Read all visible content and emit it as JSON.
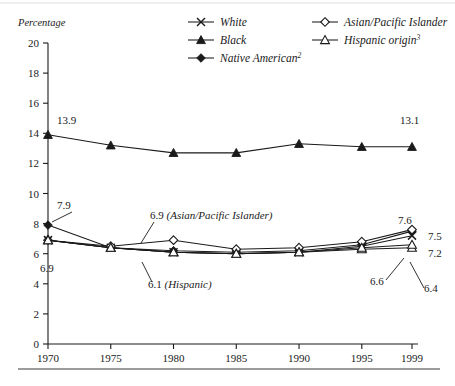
{
  "figure": {
    "y_axis_title": "Percentage",
    "top_rule": true,
    "bottom_rule": true
  },
  "legend": {
    "entries": [
      {
        "label": "White",
        "marker": "x-marker-icon",
        "col": 0,
        "row": 0
      },
      {
        "label": "Black",
        "marker": "filled-triangle-icon",
        "col": 0,
        "row": 1
      },
      {
        "label": "Native American",
        "sup": "2",
        "marker": "filled-diamond-icon",
        "col": 0,
        "row": 2
      },
      {
        "label": "Asian/Pacific Islander",
        "marker": "open-diamond-icon",
        "col": 1,
        "row": 0
      },
      {
        "label": "Hispanic origin",
        "sup": "3",
        "marker": "open-triangle-icon",
        "col": 1,
        "row": 1
      }
    ]
  },
  "annotations": [
    {
      "id": "ann-black-1970",
      "text": "13.9",
      "x": 57,
      "y": 124,
      "anchor": "start",
      "leader": false
    },
    {
      "id": "ann-black-1999",
      "text": "13.1",
      "x": 400,
      "y": 124,
      "anchor": "start",
      "leader": false
    },
    {
      "id": "ann-native-1970",
      "text": "7.9",
      "x": 57,
      "y": 209,
      "anchor": "start",
      "leader": true
    },
    {
      "id": "ann-white-1970",
      "text": "6.9",
      "x": 40,
      "y": 272,
      "anchor": "start",
      "leader": false
    },
    {
      "id": "ann-api-1980",
      "text": "6.9 (Asian/Pacific Islander)",
      "x": 150,
      "y": 219,
      "anchor": "start",
      "leader": true,
      "italic_from": 4
    },
    {
      "id": "ann-hispanic-1980",
      "text": "6.1 (Hispanic)",
      "x": 148,
      "y": 288,
      "anchor": "start",
      "leader": true,
      "italic_from": 4
    },
    {
      "id": "ann-api-1999",
      "text": "7.6",
      "x": 398,
      "y": 224,
      "anchor": "start",
      "leader": false
    },
    {
      "id": "ann-native-1999",
      "text": "7.5",
      "x": 428,
      "y": 240,
      "anchor": "start",
      "leader": false
    },
    {
      "id": "ann-white-1999",
      "text": "7.2",
      "x": 428,
      "y": 257,
      "anchor": "start",
      "leader": false
    },
    {
      "id": "ann-black2-1999",
      "text": "6.6",
      "x": 370,
      "y": 285,
      "anchor": "start",
      "leader": true
    },
    {
      "id": "ann-hispanic-1999",
      "text": "6.4",
      "x": 424,
      "y": 292,
      "anchor": "start",
      "leader": true
    }
  ],
  "chart_data": {
    "type": "line",
    "title": "",
    "xlabel": "",
    "ylabel": "Percentage",
    "x": [
      1970,
      1975,
      1980,
      1985,
      1990,
      1995,
      1999
    ],
    "xtick_labels": [
      "1970",
      "1975",
      "1980",
      "1985",
      "1990",
      "1995",
      "1999"
    ],
    "ytick_labels": [
      "0",
      "2",
      "4",
      "6",
      "8",
      "10",
      "12",
      "14",
      "16",
      "18",
      "20"
    ],
    "ylim": [
      0,
      20
    ],
    "ytick_step": 2,
    "grid": false,
    "legend_position": "top-right",
    "series": [
      {
        "name": "White",
        "marker": "x",
        "values": [
          6.9,
          6.4,
          6.1,
          6.0,
          6.1,
          6.5,
          7.2
        ]
      },
      {
        "name": "Black",
        "marker": "filled-triangle",
        "values": [
          13.9,
          13.2,
          12.7,
          12.7,
          13.3,
          13.1,
          13.1
        ]
      },
      {
        "name": "Native American",
        "marker": "filled-diamond",
        "values": [
          7.9,
          6.4,
          6.2,
          6.1,
          6.2,
          6.6,
          7.5
        ]
      },
      {
        "name": "Asian/Pacific Islander",
        "marker": "open-diamond",
        "values": [
          6.9,
          6.5,
          6.9,
          6.3,
          6.4,
          6.8,
          7.6
        ]
      },
      {
        "name": "Hispanic origin",
        "marker": "open-triangle",
        "values": [
          6.9,
          6.4,
          6.1,
          6.0,
          6.1,
          6.3,
          6.4
        ]
      },
      {
        "name": "Black secondary",
        "marker": "open-triangle",
        "values": [
          6.9,
          6.4,
          6.1,
          6.0,
          6.1,
          6.4,
          6.6
        ]
      }
    ],
    "labeled_points": [
      {
        "series": "Black",
        "x": 1970,
        "value": 13.9
      },
      {
        "series": "Black",
        "x": 1999,
        "value": 13.1
      },
      {
        "series": "Native American",
        "x": 1970,
        "value": 7.9
      },
      {
        "series": "White",
        "x": 1970,
        "value": 6.9
      },
      {
        "series": "Asian/Pacific Islander",
        "x": 1980,
        "value": 6.9
      },
      {
        "series": "Hispanic origin",
        "x": 1980,
        "value": 6.1
      },
      {
        "series": "Asian/Pacific Islander",
        "x": 1999,
        "value": 7.6
      },
      {
        "series": "Native American",
        "x": 1999,
        "value": 7.5
      },
      {
        "series": "White",
        "x": 1999,
        "value": 7.2
      },
      {
        "series": "Black secondary",
        "x": 1999,
        "value": 6.6
      },
      {
        "series": "Hispanic origin",
        "x": 1999,
        "value": 6.4
      }
    ]
  }
}
